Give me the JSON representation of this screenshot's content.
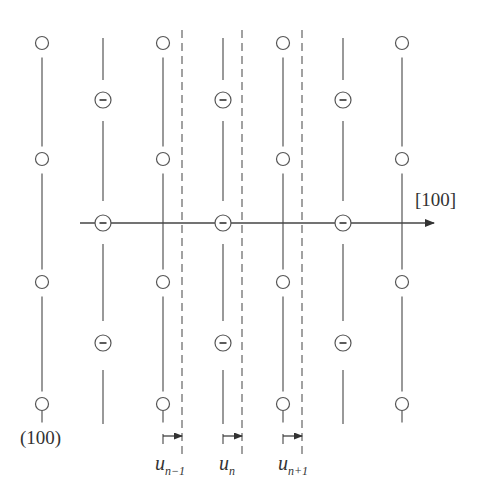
{
  "diagram": {
    "colors": {
      "stroke": "#555555",
      "text": "#333333",
      "background": "#ffffff"
    },
    "direction_label": "[100]",
    "plane_label": "(100)",
    "displacement_labels": [
      {
        "base": "u",
        "sub": "n−1"
      },
      {
        "base": "u",
        "sub": "n"
      },
      {
        "base": "u",
        "sub": "n+1"
      }
    ],
    "atom_types": {
      "neutral": "open-circle",
      "anion": "circle-with-minus"
    },
    "columns_x": [
      42,
      103,
      163,
      223,
      283,
      343,
      402
    ],
    "circle_rows_y": [
      43,
      159,
      282,
      404
    ],
    "minus_rows_y": [
      100,
      223,
      343
    ],
    "dashed_planes_x": [
      182,
      242,
      302
    ]
  }
}
